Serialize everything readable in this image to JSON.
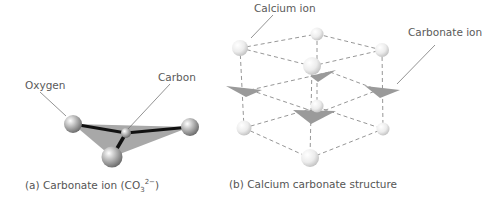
{
  "panel_a": {
    "labels": {
      "oxygen": "Oxygen",
      "carbon": "Carbon"
    },
    "caption": {
      "prefix": "(a) Carbonate ion (CO",
      "sub": "3",
      "sup": "2−",
      "suffix": ")"
    }
  },
  "panel_b": {
    "labels": {
      "calcium_ion": "Calcium ion",
      "carbonate_ion": "Carbonate ion"
    },
    "caption": "(b) Calcium carbonate structure"
  },
  "colors": {
    "atom_fill": "#bdbdbd",
    "calcium_fill": "#ececec",
    "triangle_fill": "#9e9e9e",
    "bond": "#111111",
    "dashed_edge": "#888888",
    "text": "#555555"
  }
}
